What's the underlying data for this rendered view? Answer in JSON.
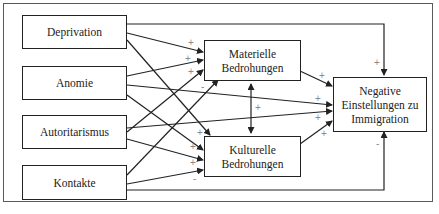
{
  "diagram": {
    "type": "path-model",
    "nodes": {
      "deprivation": {
        "label": "Deprivation"
      },
      "anomie": {
        "label": "Anomie"
      },
      "autoritarismus": {
        "label": "Autoritarismus"
      },
      "kontakte": {
        "label": "Kontakte"
      },
      "materielle": {
        "label": "Materielle\nBedrohungen"
      },
      "kulturelle": {
        "label": "Kulturelle\nBedrohungen"
      },
      "outcome": {
        "label": "Negative\nEinstellungen zu\nImmigration"
      }
    },
    "edges": [
      {
        "from": "Deprivation",
        "to": "Materielle Bedrohungen",
        "sign": "+"
      },
      {
        "from": "Anomie",
        "to": "Materielle Bedrohungen",
        "sign": "+"
      },
      {
        "from": "Autoritarismus",
        "to": "Materielle Bedrohungen",
        "sign": "+"
      },
      {
        "from": "Kontakte",
        "to": "Materielle Bedrohungen",
        "sign": "-"
      },
      {
        "from": "Deprivation",
        "to": "Kulturelle Bedrohungen",
        "sign": "+"
      },
      {
        "from": "Anomie",
        "to": "Kulturelle Bedrohungen",
        "sign": "+"
      },
      {
        "from": "Autoritarismus",
        "to": "Kulturelle Bedrohungen",
        "sign": "+"
      },
      {
        "from": "Kontakte",
        "to": "Kulturelle Bedrohungen",
        "sign": "-"
      },
      {
        "from": "Materielle Bedrohungen",
        "to": "Kulturelle Bedrohungen",
        "sign": "+",
        "bidirectional": true
      },
      {
        "from": "Materielle Bedrohungen",
        "to": "Negative Einstellungen zu Immigration",
        "sign": "+"
      },
      {
        "from": "Kulturelle Bedrohungen",
        "to": "Negative Einstellungen zu Immigration",
        "sign": "+"
      },
      {
        "from": "Deprivation",
        "to": "Negative Einstellungen zu Immigration",
        "sign": "+"
      },
      {
        "from": "Anomie",
        "to": "Negative Einstellungen zu Immigration",
        "sign": "+"
      },
      {
        "from": "Autoritarismus",
        "to": "Negative Einstellungen zu Immigration",
        "sign": "+"
      },
      {
        "from": "Kontakte",
        "to": "Negative Einstellungen zu Immigration",
        "sign": "-"
      }
    ],
    "signs": {
      "s1": "+",
      "s2": "+",
      "s3": "+",
      "s4": "-",
      "s5": "+",
      "s6": "+",
      "s7": "+",
      "s8": "-",
      "s9": "+",
      "s10": "+",
      "s11": "+",
      "s12": "+",
      "s13": "+",
      "s14": "+",
      "s15": "-"
    }
  }
}
